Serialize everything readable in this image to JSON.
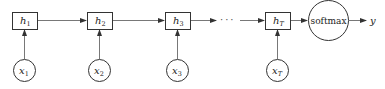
{
  "diagram": {
    "type": "rnn-unrolled",
    "colors": {
      "stroke": "#333333",
      "text": "#222222",
      "background": "#ffffff"
    },
    "hidden_states": [
      {
        "symbol": "h",
        "subscript": "1"
      },
      {
        "symbol": "h",
        "subscript": "2"
      },
      {
        "symbol": "h",
        "subscript": "3"
      },
      {
        "symbol": "h",
        "subscript": "T"
      }
    ],
    "inputs": [
      {
        "symbol": "x",
        "subscript": "1"
      },
      {
        "symbol": "x",
        "subscript": "2"
      },
      {
        "symbol": "x",
        "subscript": "3"
      },
      {
        "symbol": "x",
        "subscript": "T"
      }
    ],
    "ellipsis": "···",
    "output_node": {
      "label": "softmax"
    },
    "output": {
      "symbol": "y"
    }
  }
}
